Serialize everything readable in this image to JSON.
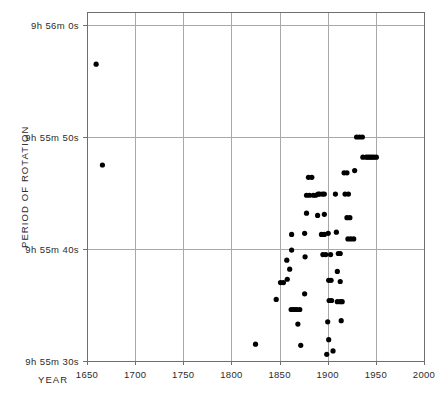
{
  "chart_data": {
    "type": "scatter",
    "title": "",
    "xlabel": "YEAR",
    "ylabel": "PERIOD OF ROTATION",
    "xlim": [
      1650,
      2000
    ],
    "ylim_seconds": [
      35730,
      35760
    ],
    "grid": true,
    "legend": null,
    "x_ticks": [
      1650,
      1700,
      1750,
      1800,
      1850,
      1900,
      1950,
      2000
    ],
    "x_tick_labels": [
      "1650",
      "1700",
      "1750",
      "1800",
      "1850",
      "1900",
      "1950",
      "2000"
    ],
    "y_ticks_seconds": [
      35760,
      35750,
      35740,
      35730
    ],
    "y_tick_labels": [
      "9h 56m  0s",
      "9h 55m 50s",
      "9h 55m 40s",
      "9h 55m 30s"
    ],
    "point_radius_px": 2.6,
    "points": [
      {
        "x": 1659.5,
        "y_seconds": 35756.5
      },
      {
        "x": 1666.0,
        "y_seconds": 35747.5
      },
      {
        "x": 1825.0,
        "y_seconds": 35731.5
      },
      {
        "x": 1846.5,
        "y_seconds": 35735.5
      },
      {
        "x": 1851.0,
        "y_seconds": 35737.0
      },
      {
        "x": 1854.0,
        "y_seconds": 35737.0
      },
      {
        "x": 1857.5,
        "y_seconds": 35739.0
      },
      {
        "x": 1858.0,
        "y_seconds": 35737.3
      },
      {
        "x": 1860.5,
        "y_seconds": 35738.2
      },
      {
        "x": 1862.5,
        "y_seconds": 35741.3
      },
      {
        "x": 1862.5,
        "y_seconds": 35739.9
      },
      {
        "x": 1862.0,
        "y_seconds": 35734.6
      },
      {
        "x": 1864.0,
        "y_seconds": 35734.6
      },
      {
        "x": 1866.0,
        "y_seconds": 35734.6
      },
      {
        "x": 1868.0,
        "y_seconds": 35734.6
      },
      {
        "x": 1871.0,
        "y_seconds": 35734.6
      },
      {
        "x": 1869.0,
        "y_seconds": 35733.3
      },
      {
        "x": 1872.0,
        "y_seconds": 35731.4
      },
      {
        "x": 1876.0,
        "y_seconds": 35741.4
      },
      {
        "x": 1876.5,
        "y_seconds": 35739.3
      },
      {
        "x": 1876.0,
        "y_seconds": 35736.0
      },
      {
        "x": 1878.0,
        "y_seconds": 35743.2
      },
      {
        "x": 1878.0,
        "y_seconds": 35744.8
      },
      {
        "x": 1881.0,
        "y_seconds": 35744.8
      },
      {
        "x": 1880.0,
        "y_seconds": 35746.4
      },
      {
        "x": 1883.5,
        "y_seconds": 35746.4
      },
      {
        "x": 1885.0,
        "y_seconds": 35744.8
      },
      {
        "x": 1887.5,
        "y_seconds": 35744.8
      },
      {
        "x": 1890.0,
        "y_seconds": 35744.9
      },
      {
        "x": 1891.5,
        "y_seconds": 35744.9
      },
      {
        "x": 1894.5,
        "y_seconds": 35744.9
      },
      {
        "x": 1896.5,
        "y_seconds": 35744.9
      },
      {
        "x": 1889.5,
        "y_seconds": 35743.0
      },
      {
        "x": 1896.5,
        "y_seconds": 35743.1
      },
      {
        "x": 1893.5,
        "y_seconds": 35741.3
      },
      {
        "x": 1896.5,
        "y_seconds": 35741.3
      },
      {
        "x": 1895.0,
        "y_seconds": 35739.5
      },
      {
        "x": 1898.0,
        "y_seconds": 35739.5
      },
      {
        "x": 1900.5,
        "y_seconds": 35741.4
      },
      {
        "x": 1903.0,
        "y_seconds": 35739.5
      },
      {
        "x": 1901.0,
        "y_seconds": 35737.2
      },
      {
        "x": 1903.5,
        "y_seconds": 35737.2
      },
      {
        "x": 1901.5,
        "y_seconds": 35735.4
      },
      {
        "x": 1904.0,
        "y_seconds": 35735.4
      },
      {
        "x": 1900.0,
        "y_seconds": 35733.5
      },
      {
        "x": 1901.0,
        "y_seconds": 35731.9
      },
      {
        "x": 1899.0,
        "y_seconds": 35730.6
      },
      {
        "x": 1905.5,
        "y_seconds": 35730.9
      },
      {
        "x": 1908.0,
        "y_seconds": 35744.9
      },
      {
        "x": 1909.0,
        "y_seconds": 35741.5
      },
      {
        "x": 1911.0,
        "y_seconds": 35739.6
      },
      {
        "x": 1913.0,
        "y_seconds": 35739.6
      },
      {
        "x": 1910.0,
        "y_seconds": 35738.0
      },
      {
        "x": 1913.0,
        "y_seconds": 35737.1
      },
      {
        "x": 1910.0,
        "y_seconds": 35735.3
      },
      {
        "x": 1913.0,
        "y_seconds": 35735.3
      },
      {
        "x": 1915.0,
        "y_seconds": 35735.3
      },
      {
        "x": 1914.0,
        "y_seconds": 35733.6
      },
      {
        "x": 1917.0,
        "y_seconds": 35746.8
      },
      {
        "x": 1920.0,
        "y_seconds": 35746.8
      },
      {
        "x": 1918.0,
        "y_seconds": 35744.9
      },
      {
        "x": 1921.5,
        "y_seconds": 35744.9
      },
      {
        "x": 1920.0,
        "y_seconds": 35742.8
      },
      {
        "x": 1923.0,
        "y_seconds": 35742.8
      },
      {
        "x": 1921.0,
        "y_seconds": 35740.9
      },
      {
        "x": 1924.0,
        "y_seconds": 35740.9
      },
      {
        "x": 1927.0,
        "y_seconds": 35740.9
      },
      {
        "x": 1928.0,
        "y_seconds": 35747.0
      },
      {
        "x": 1930.0,
        "y_seconds": 35750.0
      },
      {
        "x": 1933.0,
        "y_seconds": 35750.0
      },
      {
        "x": 1936.0,
        "y_seconds": 35750.0
      },
      {
        "x": 1936.5,
        "y_seconds": 35748.2
      },
      {
        "x": 1940.0,
        "y_seconds": 35748.2
      },
      {
        "x": 1942.0,
        "y_seconds": 35748.2
      },
      {
        "x": 1944.0,
        "y_seconds": 35748.2
      },
      {
        "x": 1946.0,
        "y_seconds": 35748.2
      },
      {
        "x": 1948.0,
        "y_seconds": 35748.2
      },
      {
        "x": 1950.5,
        "y_seconds": 35748.2
      }
    ]
  }
}
